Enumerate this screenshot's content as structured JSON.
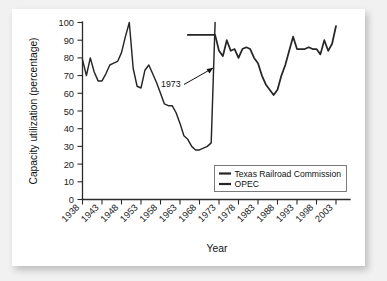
{
  "figure": {
    "background_color": "#ffffff",
    "page_background_color": "#f1f1f1",
    "line_color": "#262626"
  },
  "annotation": {
    "label": "1973"
  },
  "chart_data": {
    "type": "line",
    "title": "",
    "xlabel": "Year",
    "ylabel": "Capacity utilization (percentage)",
    "xlim": [
      1937,
      2005
    ],
    "ylim": [
      0,
      100
    ],
    "grid": false,
    "legend_position": "lower right",
    "xticks": [
      1938,
      1943,
      1948,
      1953,
      1958,
      1963,
      1968,
      1973,
      1978,
      1983,
      1988,
      1993,
      1998,
      2003
    ],
    "xtick_labels": [
      "1938",
      "1943",
      "1948",
      "1953",
      "1958",
      "1963",
      "1968",
      "1973",
      "1978",
      "1983",
      "1988",
      "1993",
      "1998",
      "2003"
    ],
    "yticks": [
      0,
      10,
      20,
      30,
      40,
      50,
      60,
      70,
      80,
      90,
      100
    ],
    "ytick_labels": [
      "0",
      "10",
      "20",
      "30",
      "40",
      "50",
      "60",
      "70",
      "80",
      "90",
      "100"
    ],
    "annotations": [
      {
        "text": "1973",
        "x": 1966,
        "y": 72,
        "points_to_x": 1972.5,
        "points_to_y": 84
      }
    ],
    "series": [
      {
        "name": "Texas Railroad Commission",
        "x": [
          1938,
          1939,
          1940,
          1941,
          1942,
          1943,
          1944,
          1945,
          1946,
          1947,
          1948,
          1949,
          1950,
          1951,
          1952,
          1953,
          1954,
          1955,
          1956,
          1957,
          1958,
          1959,
          1960,
          1961,
          1962,
          1963,
          1964,
          1965,
          1966,
          1967,
          1968,
          1969,
          1970,
          1971,
          1972
        ],
        "values": [
          79,
          70,
          80,
          72,
          67,
          67,
          71,
          76,
          77,
          78,
          83,
          92,
          100,
          74,
          64,
          63,
          73,
          76,
          71,
          66,
          60,
          54,
          53,
          53,
          49,
          43,
          36,
          34,
          30,
          28,
          28,
          29,
          30,
          32,
          100
        ]
      },
      {
        "name": "OPEC",
        "x": [
          1965,
          1966,
          1967,
          1968,
          1969,
          1970,
          1971,
          1972,
          1973,
          1974,
          1975,
          1976,
          1977,
          1978,
          1979,
          1980,
          1981,
          1982,
          1983,
          1984,
          1985,
          1986,
          1987,
          1988,
          1989,
          1990,
          1991,
          1992,
          1993,
          1994,
          1995,
          1996,
          1997,
          1998,
          1999,
          2000,
          2001,
          2002,
          2003
        ],
        "values": [
          93,
          93,
          93,
          93,
          93,
          93,
          93,
          93,
          84,
          81,
          90,
          84,
          85,
          80,
          85,
          86,
          85,
          80,
          77,
          70,
          65,
          62,
          59,
          62,
          70,
          76,
          84,
          92,
          85,
          85,
          85,
          86,
          85,
          85,
          82,
          90,
          84,
          88,
          98
        ]
      }
    ],
    "legend": [
      {
        "label": "Texas Railroad Commission"
      },
      {
        "label": "OPEC"
      }
    ]
  }
}
